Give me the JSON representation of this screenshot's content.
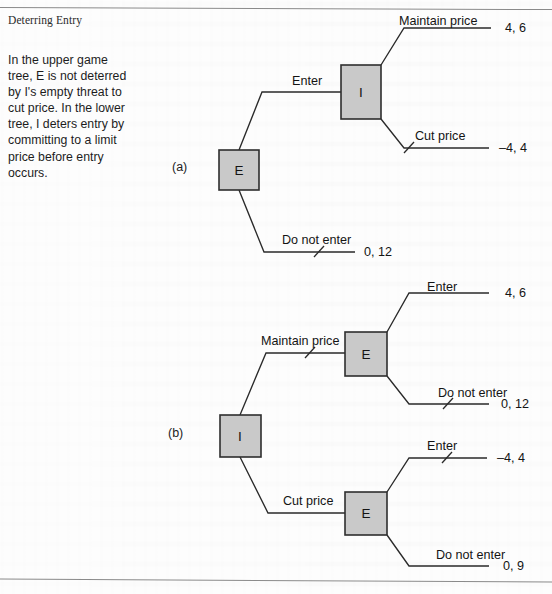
{
  "figure": {
    "title": "Deterring Entry",
    "description": "In the upper game tree, E is not deterred by I's empty threat to cut price. In the lower tree, I deters entry by committing to a limit price before entry occurs.",
    "panel_a_label": "(a)",
    "panel_b_label": "(b)",
    "node_fill_color": "#c9c9c9",
    "node_stroke_color": "#2e2e2e",
    "line_color": "#2a2a2a"
  },
  "tree_a": {
    "root_node": "E",
    "second_node": "I",
    "labels": {
      "enter": "Enter",
      "do_not_enter": "Do not enter",
      "maintain_price": "Maintain price",
      "cut_price": "Cut price"
    },
    "payoffs": {
      "maintain_price": "4, 6",
      "cut_price": "–4, 4",
      "do_not_enter": "0, 12"
    }
  },
  "tree_b": {
    "root_node": "I",
    "upper_node": "E",
    "lower_node": "E",
    "labels": {
      "maintain_price": "Maintain price",
      "cut_price": "Cut price",
      "enter_upper": "Enter",
      "do_not_enter_upper": "Do not enter",
      "enter_lower": "Enter",
      "do_not_enter_lower": "Do not enter"
    },
    "payoffs": {
      "maintain_enter": "4, 6",
      "maintain_do_not_enter": "0, 12",
      "cut_enter": "–4, 4",
      "cut_do_not_enter": "0, 9"
    }
  }
}
